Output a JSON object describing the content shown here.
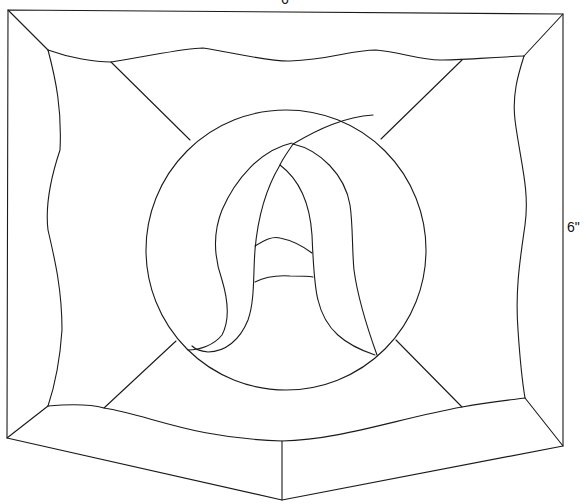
{
  "diagram": {
    "type": "stained-glass-pattern",
    "dimensions": {
      "width_label": "6\"",
      "height_label": "6\""
    },
    "colors": {
      "line": "#1a1a1a",
      "background": "#ffffff"
    }
  }
}
